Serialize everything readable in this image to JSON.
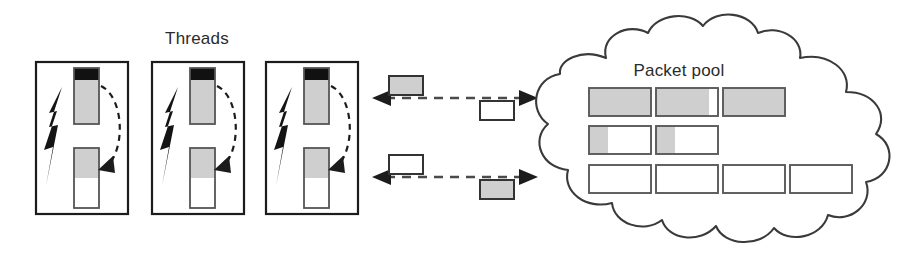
{
  "figure": {
    "title_threads": "Threads",
    "title_pool": "Packet pool",
    "type": "diagram"
  },
  "colors": {
    "gray_fill": "#cfcfcf",
    "black_fill": "#111111",
    "white_fill": "#ffffff",
    "outline": "#1c1c1c",
    "pool_outline": "#5a5a5a",
    "cloud_outline": "#3a3a3a",
    "dashed_link": "#4a4a4a",
    "text": "#2b2b2b"
  },
  "threads": {
    "label": "Threads",
    "count": 3,
    "items": [
      {
        "name": "thread-1",
        "frame": {
          "x": 36,
          "y": 62,
          "w": 92,
          "h": 152
        },
        "bolt_icon": "lightning-bolt-icon",
        "in_bar": {
          "x": 74,
          "y": 68,
          "w": 25,
          "h": 56,
          "black_fraction": 0.22,
          "gray_fraction": 0.78,
          "white_fraction": 0.0
        },
        "out_bar": {
          "x": 74,
          "y": 148,
          "w": 25,
          "h": 60,
          "gray_fraction": 0.5,
          "white_fraction": 0.5
        },
        "flow_arrow": "curved-dashed-arrow"
      },
      {
        "name": "thread-2",
        "frame": {
          "x": 152,
          "y": 62,
          "w": 92,
          "h": 152
        },
        "bolt_icon": "lightning-bolt-icon",
        "in_bar": {
          "x": 190,
          "y": 68,
          "w": 25,
          "h": 56,
          "black_fraction": 0.22,
          "gray_fraction": 0.78,
          "white_fraction": 0.0
        },
        "out_bar": {
          "x": 190,
          "y": 148,
          "w": 25,
          "h": 60,
          "gray_fraction": 0.5,
          "white_fraction": 0.5
        },
        "flow_arrow": "curved-dashed-arrow"
      },
      {
        "name": "thread-3",
        "frame": {
          "x": 266,
          "y": 62,
          "w": 92,
          "h": 152
        },
        "bolt_icon": "lightning-bolt-icon",
        "in_bar": {
          "x": 304,
          "y": 68,
          "w": 25,
          "h": 56,
          "black_fraction": 0.22,
          "gray_fraction": 0.78,
          "white_fraction": 0.0
        },
        "out_bar": {
          "x": 304,
          "y": 148,
          "w": 25,
          "h": 60,
          "gray_fraction": 0.5,
          "white_fraction": 0.5
        },
        "flow_arrow": "curved-dashed-arrow"
      }
    ]
  },
  "links": [
    {
      "name": "link-top",
      "direction": "bidirectional",
      "line": {
        "x1": 374,
        "y1": 98,
        "x2": 534,
        "y2": 98
      },
      "packets": [
        {
          "name": "packet-outbound-top",
          "fill": "gray",
          "x": 389,
          "y": 76,
          "w": 34,
          "h": 19
        },
        {
          "name": "packet-inbound-top",
          "fill": "white",
          "x": 480,
          "y": 101,
          "w": 34,
          "h": 19
        }
      ]
    },
    {
      "name": "link-bottom",
      "direction": "bidirectional",
      "line": {
        "x1": 374,
        "y1": 177,
        "x2": 534,
        "y2": 177
      },
      "packets": [
        {
          "name": "packet-outbound-bottom",
          "fill": "white",
          "x": 389,
          "y": 155,
          "w": 34,
          "h": 19
        },
        {
          "name": "packet-inbound-bottom",
          "fill": "gray",
          "x": 480,
          "y": 180,
          "w": 34,
          "h": 19
        }
      ]
    }
  ],
  "packet_pool": {
    "label": "Packet pool",
    "label_pos": {
      "x": 679,
      "y": 76
    },
    "total_packets": 9,
    "rows": [
      {
        "name": "pool-row-1",
        "y": 88,
        "h": 28,
        "packets": [
          {
            "name": "pool-packet-1",
            "x": 589,
            "w": 62,
            "gray_fraction": 1.0
          },
          {
            "name": "pool-packet-2",
            "x": 656,
            "w": 62,
            "gray_fraction": 0.85
          },
          {
            "name": "pool-packet-3",
            "x": 723,
            "w": 62,
            "gray_fraction": 1.0
          }
        ]
      },
      {
        "name": "pool-row-2",
        "y": 126,
        "h": 28,
        "packets": [
          {
            "name": "pool-packet-4",
            "x": 589,
            "w": 62,
            "gray_fraction": 0.3
          },
          {
            "name": "pool-packet-5",
            "x": 656,
            "w": 62,
            "gray_fraction": 0.3
          }
        ]
      },
      {
        "name": "pool-row-3",
        "y": 165,
        "h": 28,
        "packets": [
          {
            "name": "pool-packet-6",
            "x": 589,
            "w": 62,
            "gray_fraction": 0.0
          },
          {
            "name": "pool-packet-7",
            "x": 656,
            "w": 62,
            "gray_fraction": 0.0
          },
          {
            "name": "pool-packet-8",
            "x": 723,
            "w": 62,
            "gray_fraction": 0.0
          },
          {
            "name": "pool-packet-9",
            "x": 790,
            "w": 62,
            "gray_fraction": 0.0
          }
        ]
      }
    ]
  }
}
